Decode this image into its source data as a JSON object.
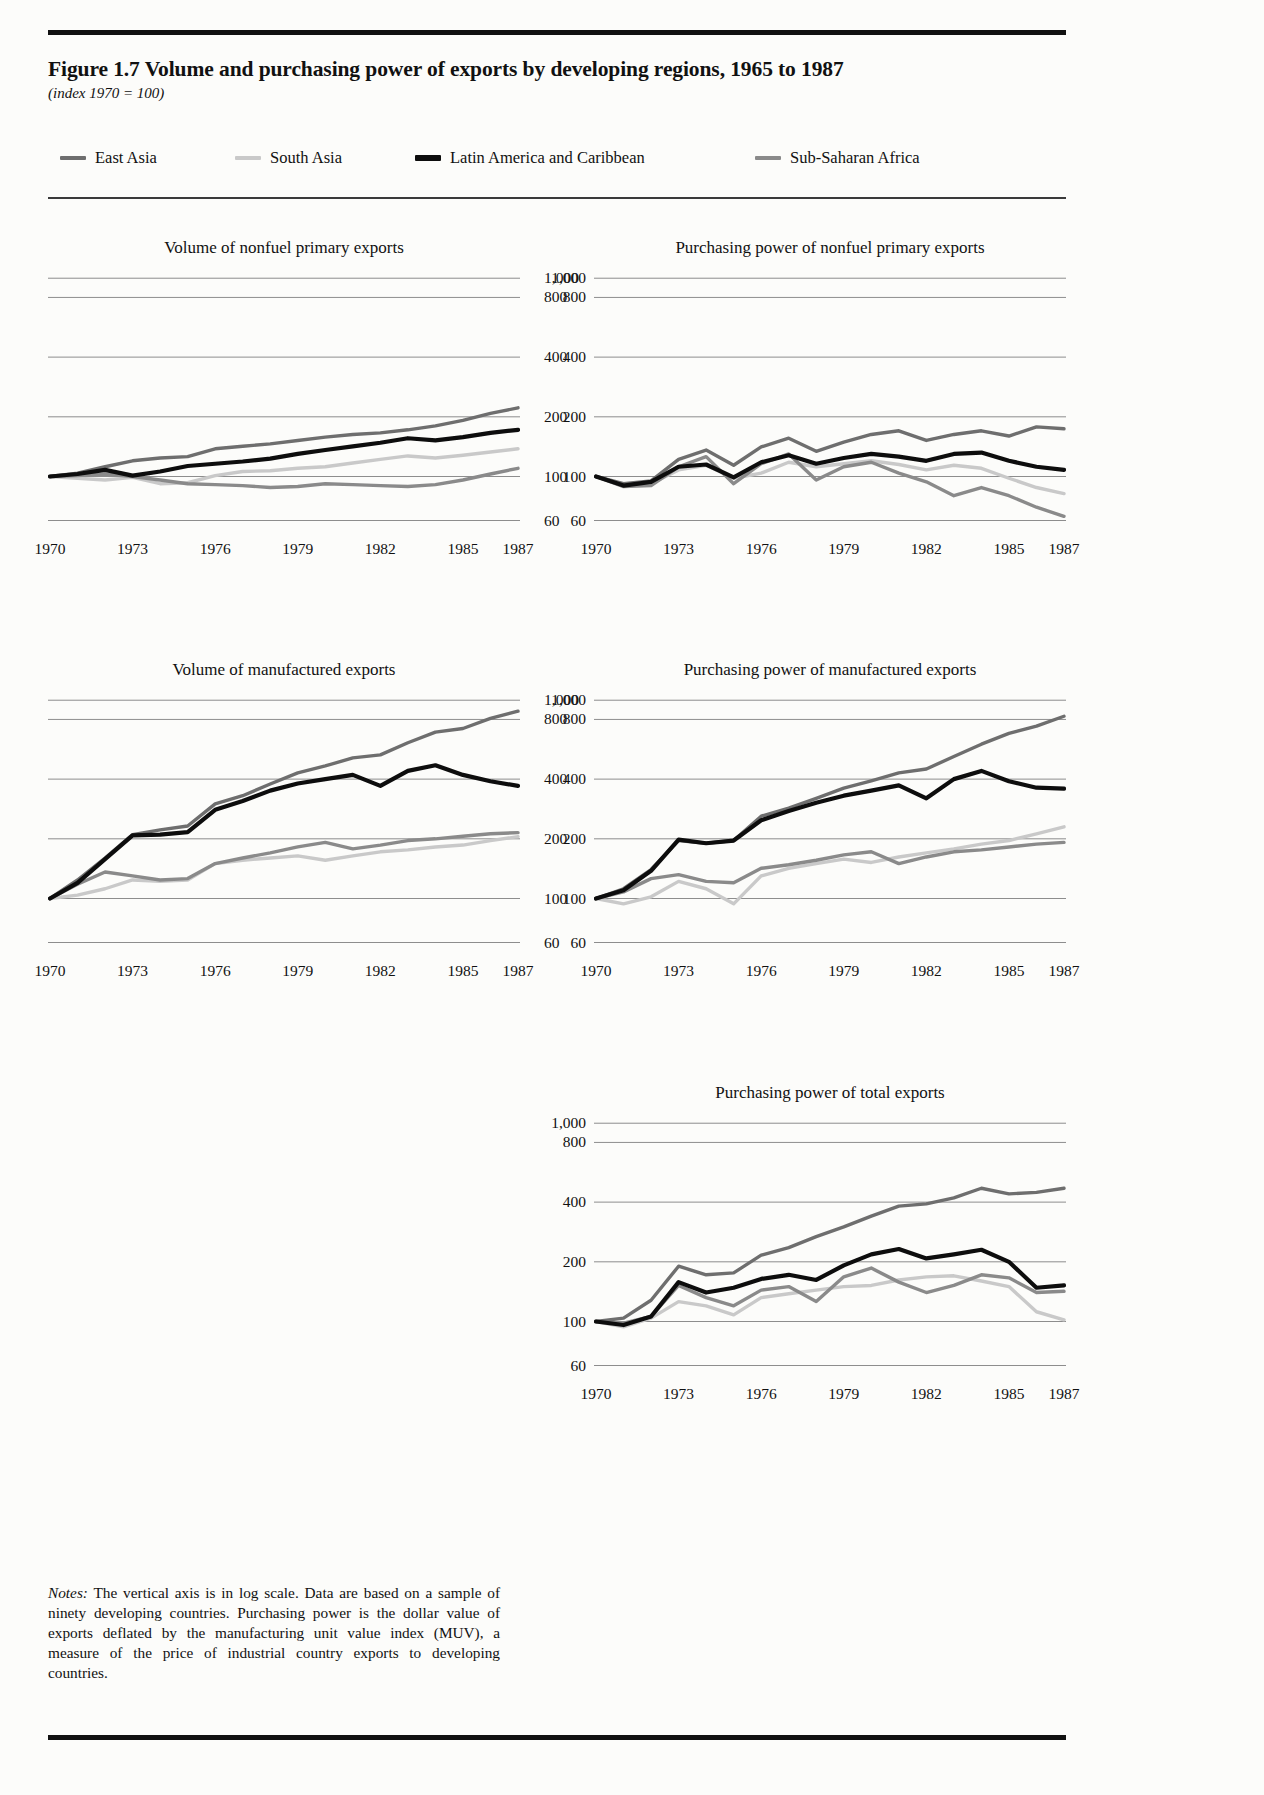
{
  "figure": {
    "title": "Figure 1.7  Volume and purchasing power of exports by developing regions, 1965 to 1987",
    "subtitle": "(index 1970 = 100)",
    "notes_label": "Notes:",
    "notes": " The vertical axis is in log scale. Data are based on a sample of ninety developing countries. Purchasing power is the dollar value of exports deflated by the manufacturing unit value index (MUV), a measure of the price of industrial country exports to developing countries."
  },
  "legend": {
    "items": [
      {
        "label": "East Asia",
        "color": "#6e6e6e"
      },
      {
        "label": "South Asia",
        "color": "#c9c9c9"
      },
      {
        "label": "Latin America and Caribbean",
        "color": "#0d0d0d"
      },
      {
        "label": "Sub-Saharan Africa",
        "color": "#8a8a8a"
      }
    ]
  },
  "axis": {
    "ylabels": [
      "1,000",
      "800",
      "400",
      "200",
      "100",
      "60"
    ],
    "yticks": [
      1000,
      800,
      400,
      200,
      100,
      60
    ],
    "xlabels": [
      "1970",
      "1973",
      "1976",
      "1979",
      "1982",
      "1985",
      "1987"
    ],
    "xticks": [
      1970,
      1973,
      1976,
      1979,
      1982,
      1985,
      1987
    ],
    "xlim": [
      1970,
      1987
    ],
    "ylim": [
      55,
      1100
    ],
    "scale": "log"
  },
  "chart_data": [
    {
      "id": "volume-nonfuel-primary",
      "type": "line",
      "title": "Volume of nonfuel primary exports",
      "xlabel": "",
      "ylabel": "index 1970 = 100",
      "ylim": [
        55,
        1100
      ],
      "xlim": [
        1970,
        1987
      ],
      "grid": true,
      "scale": "log",
      "x": [
        1970,
        1971,
        1972,
        1973,
        1974,
        1975,
        1976,
        1977,
        1978,
        1979,
        1980,
        1981,
        1982,
        1983,
        1984,
        1985,
        1986,
        1987
      ],
      "series": [
        {
          "name": "East Asia",
          "color": "#6e6e6e",
          "values": [
            100,
            104,
            112,
            120,
            124,
            126,
            138,
            142,
            146,
            152,
            158,
            163,
            166,
            172,
            180,
            192,
            208,
            222
          ]
        },
        {
          "name": "South Asia",
          "color": "#c9c9c9",
          "values": [
            100,
            98,
            96,
            99,
            92,
            93,
            101,
            106,
            107,
            110,
            112,
            117,
            122,
            127,
            124,
            128,
            133,
            138
          ]
        },
        {
          "name": "Latin America and Caribbean",
          "color": "#0d0d0d",
          "values": [
            100,
            103,
            108,
            101,
            106,
            113,
            116,
            119,
            123,
            130,
            136,
            142,
            148,
            156,
            152,
            158,
            166,
            172
          ]
        },
        {
          "name": "Sub-Saharan Africa",
          "color": "#8a8a8a",
          "values": [
            100,
            101,
            103,
            100,
            96,
            92,
            91,
            90,
            88,
            89,
            92,
            91,
            90,
            89,
            91,
            96,
            103,
            110
          ]
        }
      ]
    },
    {
      "id": "purchasing-power-nonfuel-primary",
      "type": "line",
      "title": "Purchasing power of nonfuel primary exports",
      "xlabel": "",
      "ylabel": "index 1970 = 100",
      "ylim": [
        55,
        1100
      ],
      "xlim": [
        1970,
        1987
      ],
      "grid": true,
      "scale": "log",
      "x": [
        1970,
        1971,
        1972,
        1973,
        1974,
        1975,
        1976,
        1977,
        1978,
        1979,
        1980,
        1981,
        1982,
        1983,
        1984,
        1985,
        1986,
        1987
      ],
      "series": [
        {
          "name": "East Asia",
          "color": "#6e6e6e",
          "values": [
            100,
            92,
            95,
            122,
            136,
            114,
            141,
            156,
            134,
            149,
            163,
            170,
            152,
            163,
            170,
            160,
            178,
            174
          ]
        },
        {
          "name": "South Asia",
          "color": "#c9c9c9",
          "values": [
            100,
            91,
            92,
            108,
            114,
            98,
            104,
            118,
            112,
            116,
            120,
            115,
            108,
            114,
            110,
            98,
            88,
            82
          ]
        },
        {
          "name": "Latin America and Caribbean",
          "color": "#0d0d0d",
          "values": [
            100,
            90,
            94,
            112,
            115,
            99,
            118,
            128,
            116,
            124,
            130,
            126,
            120,
            130,
            132,
            120,
            112,
            108
          ]
        },
        {
          "name": "Sub-Saharan Africa",
          "color": "#8a8a8a",
          "values": [
            100,
            89,
            90,
            112,
            126,
            92,
            116,
            130,
            96,
            112,
            118,
            104,
            94,
            80,
            88,
            80,
            70,
            63
          ]
        }
      ]
    },
    {
      "id": "volume-manufactured",
      "type": "line",
      "title": "Volume of manufactured exports",
      "xlabel": "",
      "ylabel": "index 1970 = 100",
      "ylim": [
        55,
        1100
      ],
      "xlim": [
        1970,
        1987
      ],
      "grid": true,
      "scale": "log",
      "x": [
        1970,
        1971,
        1972,
        1973,
        1974,
        1975,
        1976,
        1977,
        1978,
        1979,
        1980,
        1981,
        1982,
        1983,
        1984,
        1985,
        1986,
        1987
      ],
      "series": [
        {
          "name": "East Asia",
          "color": "#6e6e6e",
          "values": [
            100,
            124,
            160,
            210,
            222,
            232,
            300,
            330,
            378,
            430,
            466,
            512,
            530,
            610,
            690,
            720,
            810,
            880
          ]
        },
        {
          "name": "South Asia",
          "color": "#c9c9c9",
          "values": [
            100,
            104,
            112,
            124,
            122,
            124,
            150,
            156,
            160,
            164,
            156,
            164,
            172,
            176,
            182,
            186,
            196,
            205
          ]
        },
        {
          "name": "Latin America and Caribbean",
          "color": "#0d0d0d",
          "values": [
            100,
            120,
            158,
            208,
            210,
            216,
            280,
            310,
            350,
            380,
            400,
            420,
            370,
            440,
            470,
            420,
            390,
            370
          ]
        },
        {
          "name": "Sub-Saharan Africa",
          "color": "#8a8a8a",
          "values": [
            100,
            118,
            136,
            130,
            124,
            126,
            150,
            160,
            170,
            182,
            192,
            178,
            186,
            196,
            200,
            206,
            212,
            215
          ]
        }
      ]
    },
    {
      "id": "purchasing-power-manufactured",
      "type": "line",
      "title": "Purchasing power of manufactured exports",
      "xlabel": "",
      "ylabel": "index 1970 = 100",
      "ylim": [
        55,
        1100
      ],
      "xlim": [
        1970,
        1987
      ],
      "grid": true,
      "scale": "log",
      "x": [
        1970,
        1971,
        1972,
        1973,
        1974,
        1975,
        1976,
        1977,
        1978,
        1979,
        1980,
        1981,
        1982,
        1983,
        1984,
        1985,
        1986,
        1987
      ],
      "series": [
        {
          "name": "East Asia",
          "color": "#6e6e6e",
          "values": [
            100,
            112,
            140,
            196,
            190,
            196,
            260,
            286,
            320,
            360,
            392,
            430,
            450,
            520,
            600,
            680,
            740,
            830
          ]
        },
        {
          "name": "South Asia",
          "color": "#c9c9c9",
          "values": [
            100,
            94,
            102,
            122,
            112,
            94,
            130,
            142,
            150,
            158,
            152,
            162,
            170,
            178,
            188,
            196,
            212,
            230
          ]
        },
        {
          "name": "Latin America and Caribbean",
          "color": "#0d0d0d",
          "values": [
            100,
            110,
            138,
            198,
            190,
            196,
            248,
            276,
            304,
            330,
            350,
            372,
            320,
            400,
            440,
            390,
            362,
            358
          ]
        },
        {
          "name": "Sub-Saharan Africa",
          "color": "#8a8a8a",
          "values": [
            100,
            108,
            126,
            132,
            122,
            120,
            142,
            148,
            156,
            166,
            172,
            150,
            162,
            172,
            176,
            182,
            188,
            192
          ]
        }
      ]
    },
    {
      "id": "purchasing-power-total",
      "type": "line",
      "title": "Purchasing power of total exports",
      "xlabel": "",
      "ylabel": "index 1970 = 100",
      "ylim": [
        55,
        1100
      ],
      "xlim": [
        1970,
        1987
      ],
      "grid": true,
      "scale": "log",
      "x": [
        1970,
        1971,
        1972,
        1973,
        1974,
        1975,
        1976,
        1977,
        1978,
        1979,
        1980,
        1981,
        1982,
        1983,
        1984,
        1985,
        1986,
        1987
      ],
      "series": [
        {
          "name": "East Asia",
          "color": "#6e6e6e",
          "values": [
            100,
            104,
            128,
            190,
            172,
            176,
            216,
            236,
            268,
            300,
            340,
            382,
            392,
            420,
            470,
            440,
            448,
            470
          ]
        },
        {
          "name": "South Asia",
          "color": "#c9c9c9",
          "values": [
            100,
            94,
            104,
            126,
            120,
            108,
            132,
            138,
            144,
            150,
            152,
            162,
            168,
            170,
            160,
            150,
            112,
            102
          ]
        },
        {
          "name": "Latin America and Caribbean",
          "color": "#0d0d0d",
          "values": [
            100,
            96,
            106,
            158,
            140,
            148,
            164,
            172,
            162,
            192,
            218,
            232,
            208,
            218,
            230,
            200,
            148,
            152
          ]
        },
        {
          "name": "Sub-Saharan Africa",
          "color": "#8a8a8a",
          "values": [
            100,
            98,
            106,
            152,
            132,
            120,
            144,
            150,
            126,
            168,
            186,
            158,
            140,
            152,
            172,
            166,
            140,
            142
          ]
        }
      ]
    }
  ]
}
